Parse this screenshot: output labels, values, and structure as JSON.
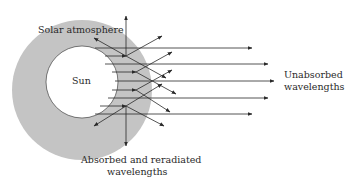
{
  "diagram": {
    "labels": {
      "atmosphere": "Solar atmosphere",
      "sun": "Sun",
      "unabsorbed_line1": "Unabsorbed",
      "unabsorbed_line2": "wavelengths",
      "absorbed_line1": "Absorbed and reradiated",
      "absorbed_line2": "wavelengths"
    },
    "colors": {
      "atmosphere": "#c4c4c4",
      "sun": "#ffffff",
      "lines": "#2a2a2a"
    }
  }
}
